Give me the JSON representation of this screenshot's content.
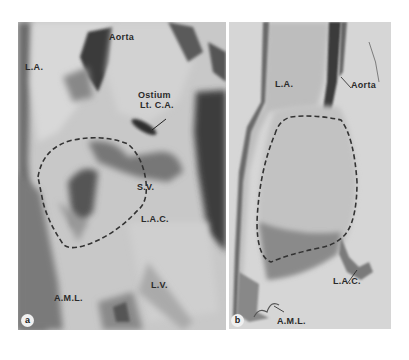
{
  "figure": {
    "panels": [
      {
        "id": "a",
        "letter": "a",
        "labels": {
          "aorta": "Aorta",
          "la": "L.A.",
          "ostium_line1": "Ostium",
          "ostium_line2": "Lt. C.A.",
          "sv": "S.V.",
          "lac": "L.A.C.",
          "lv": "L.V.",
          "aml": "A.M.L."
        }
      },
      {
        "id": "b",
        "letter": "b",
        "labels": {
          "la": "L.A.",
          "aorta": "Aorta",
          "lac": "L.A.C.",
          "aml": "A.M.L."
        }
      }
    ],
    "colors": {
      "background": "#ffffff",
      "tissue_light": "#d0d0d0",
      "tissue_dark": "#555555",
      "outline_dash": "#333333"
    }
  }
}
